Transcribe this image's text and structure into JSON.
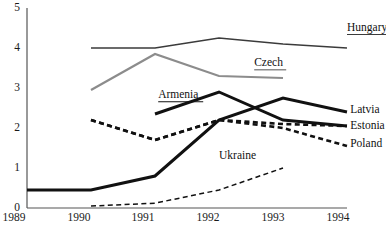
{
  "chart_data": {
    "type": "line",
    "title": "",
    "subtitle": "",
    "xlabel": "",
    "ylabel": "",
    "x": [
      1989,
      1990,
      1991,
      1992,
      1993,
      1994
    ],
    "xlim": [
      1989,
      1994
    ],
    "ylim": [
      0,
      5
    ],
    "y_ticks": [
      "0",
      "1",
      "2",
      "3",
      "4",
      "5"
    ],
    "x_ticks": [
      "1989",
      "1990",
      "1991",
      "1992",
      "1993",
      "1994"
    ],
    "grid": false,
    "legend": "inline-end-labels",
    "series": [
      {
        "name": "Hungary",
        "label": "Hungary",
        "color": "#3b3b3b",
        "style": "solid",
        "width": 1.6,
        "x": [
          1990,
          1991,
          1992,
          1993,
          1994
        ],
        "values": [
          4.0,
          4.0,
          4.25,
          4.1,
          4.0
        ],
        "label_x": 1994.0,
        "label_y": 4.5
      },
      {
        "name": "Czech",
        "label": "Czech",
        "color": "#8c8c8c",
        "style": "solid",
        "width": 2.2,
        "x": [
          1990,
          1991,
          1992,
          1993
        ],
        "values": [
          2.95,
          3.85,
          3.3,
          3.25
        ],
        "label_x": 1992.55,
        "label_y": 3.62
      },
      {
        "name": "Armenia",
        "label": "Armenia",
        "color": "#111111",
        "style": "solid",
        "width": 3.0,
        "x": [
          1991,
          1992,
          1993,
          1994
        ],
        "values": [
          2.35,
          2.9,
          2.2,
          2.05
        ],
        "label_x": 1991.05,
        "label_y": 2.82
      },
      {
        "name": "Latvia",
        "label": "Latvia",
        "color": "#111111",
        "style": "solid",
        "width": 3.0,
        "x": [
          1989,
          1990,
          1991,
          1992,
          1993,
          1994
        ],
        "values": [
          0.45,
          0.45,
          0.8,
          2.2,
          2.75,
          2.4
        ],
        "label_x": 1994.05,
        "label_y": 2.45
      },
      {
        "name": "Estonia",
        "label": "Estonia",
        "color": "#111111",
        "style": "dashed",
        "width": 2.6,
        "x": [
          1990,
          1991,
          1992,
          1993,
          1994
        ],
        "values": [
          2.2,
          1.7,
          2.2,
          2.1,
          2.05
        ],
        "label_x": 1994.05,
        "label_y": 2.05
      },
      {
        "name": "Poland",
        "label": "Poland",
        "color": "#111111",
        "style": "dashed",
        "width": 2.6,
        "x": [
          1990,
          1991,
          1992,
          1993,
          1994
        ],
        "values": [
          2.2,
          1.7,
          2.2,
          2.0,
          1.55
        ],
        "label_x": 1994.05,
        "label_y": 1.6
      },
      {
        "name": "Ukraine",
        "label": "Ukraine",
        "color": "#111111",
        "style": "dashed-thin",
        "width": 1.5,
        "x": [
          1990,
          1991,
          1992,
          1993
        ],
        "values": [
          0.05,
          0.12,
          0.45,
          1.0
        ],
        "label_x": 1992.0,
        "label_y": 1.3
      }
    ],
    "axis_color": "#444444"
  }
}
